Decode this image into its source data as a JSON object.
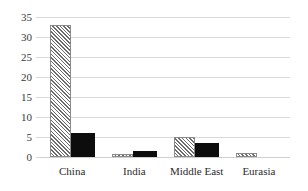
{
  "chart_data": {
    "type": "bar",
    "title": "",
    "xlabel": "",
    "ylabel": "",
    "ylim": [
      0,
      35
    ],
    "yticks": [
      0,
      5,
      10,
      15,
      20,
      25,
      30,
      35
    ],
    "grid": true,
    "legend": "none",
    "categories": [
      "China",
      "India",
      "Middle East",
      "Eurasia"
    ],
    "series": [
      {
        "name": "hatched",
        "style": "diagonal-hatch",
        "color": "#6b6b6b",
        "values": [
          33,
          0.8,
          5,
          1
        ]
      },
      {
        "name": "solid",
        "style": "solid-fill",
        "color": "#0d0d0d",
        "values": [
          6,
          1.5,
          3.5,
          0
        ]
      }
    ]
  },
  "axis": {
    "ytick_labels": [
      "0",
      "5",
      "10",
      "15",
      "20",
      "25",
      "30",
      "35"
    ]
  },
  "categories": [
    {
      "label": "China"
    },
    {
      "label": "India"
    },
    {
      "label": "Middle East"
    },
    {
      "label": "Eurasia"
    }
  ]
}
